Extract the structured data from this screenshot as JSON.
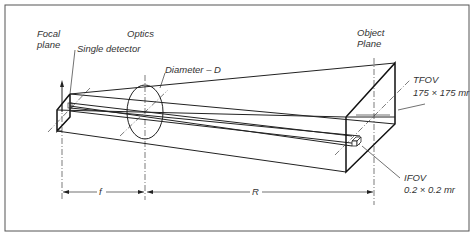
{
  "figure": {
    "labels": {
      "focal_plane_line1": "Focal",
      "focal_plane_line2": "plane",
      "optics": "Optics",
      "single_detector": "Single detector",
      "diameter": "Diameter – D",
      "object_plane_line1": "Object",
      "object_plane_line2": "Plane",
      "tfov": "TFOV",
      "tfov_value": "175 × 175 mr",
      "ifov": "IFOV",
      "ifov_value": "0.2 × 0.2 mr",
      "focal_length": "f",
      "range": "R"
    },
    "colors": {
      "line": "#222222",
      "text": "#333333",
      "background": "#ffffff"
    }
  }
}
